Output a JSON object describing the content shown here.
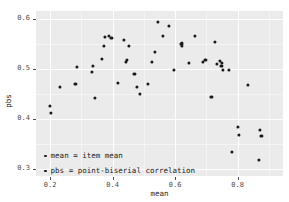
{
  "chart_data": {
    "type": "scatter",
    "title": "",
    "xlabel": "mean",
    "ylabel": "pbs",
    "xlim": [
      0.155,
      0.945
    ],
    "ylim": [
      0.285,
      0.615
    ],
    "xticks": [
      0.2,
      0.4,
      0.6,
      0.8
    ],
    "xtick_labels": [
      "0.2",
      "0.4",
      "0.6",
      "0.8"
    ],
    "yticks": [
      0.3,
      0.4,
      0.5,
      0.6
    ],
    "ytick_labels": [
      "0.3",
      "0.4",
      "0.5",
      "0.6"
    ],
    "grid": true,
    "grid_major_color": "#ffffff",
    "panel_background": "#ebebeb",
    "point_color": "#1a1a1a",
    "legend": {
      "position": "inside-bottom-left",
      "entries": [
        "mean = item mean",
        "pbs = point-biserial correlation"
      ]
    },
    "points": [
      {
        "x": 0.2,
        "y": 0.425
      },
      {
        "x": 0.203,
        "y": 0.412
      },
      {
        "x": 0.232,
        "y": 0.464
      },
      {
        "x": 0.281,
        "y": 0.47
      },
      {
        "x": 0.286,
        "y": 0.503
      },
      {
        "x": 0.334,
        "y": 0.494
      },
      {
        "x": 0.338,
        "y": 0.506
      },
      {
        "x": 0.344,
        "y": 0.442
      },
      {
        "x": 0.366,
        "y": 0.52
      },
      {
        "x": 0.372,
        "y": 0.545
      },
      {
        "x": 0.375,
        "y": 0.563
      },
      {
        "x": 0.388,
        "y": 0.566
      },
      {
        "x": 0.396,
        "y": 0.561
      },
      {
        "x": 0.416,
        "y": 0.471
      },
      {
        "x": 0.435,
        "y": 0.557
      },
      {
        "x": 0.443,
        "y": 0.514
      },
      {
        "x": 0.446,
        "y": 0.518
      },
      {
        "x": 0.452,
        "y": 0.546
      },
      {
        "x": 0.47,
        "y": 0.489
      },
      {
        "x": 0.478,
        "y": 0.464
      },
      {
        "x": 0.488,
        "y": 0.449
      },
      {
        "x": 0.513,
        "y": 0.469
      },
      {
        "x": 0.525,
        "y": 0.514
      },
      {
        "x": 0.536,
        "y": 0.533
      },
      {
        "x": 0.545,
        "y": 0.593
      },
      {
        "x": 0.562,
        "y": 0.565
      },
      {
        "x": 0.58,
        "y": 0.586
      },
      {
        "x": 0.597,
        "y": 0.498
      },
      {
        "x": 0.62,
        "y": 0.549
      },
      {
        "x": 0.621,
        "y": 0.546
      },
      {
        "x": 0.622,
        "y": 0.552
      },
      {
        "x": 0.643,
        "y": 0.511
      },
      {
        "x": 0.664,
        "y": 0.565
      },
      {
        "x": 0.688,
        "y": 0.513
      },
      {
        "x": 0.697,
        "y": 0.517
      },
      {
        "x": 0.716,
        "y": 0.443
      },
      {
        "x": 0.726,
        "y": 0.554
      },
      {
        "x": 0.733,
        "y": 0.509
      },
      {
        "x": 0.744,
        "y": 0.516
      },
      {
        "x": 0.748,
        "y": 0.506
      },
      {
        "x": 0.75,
        "y": 0.511
      },
      {
        "x": 0.752,
        "y": 0.498
      },
      {
        "x": 0.772,
        "y": 0.497
      },
      {
        "x": 0.782,
        "y": 0.333
      },
      {
        "x": 0.8,
        "y": 0.383
      },
      {
        "x": 0.805,
        "y": 0.368
      },
      {
        "x": 0.832,
        "y": 0.468
      },
      {
        "x": 0.872,
        "y": 0.377
      },
      {
        "x": 0.876,
        "y": 0.366
      },
      {
        "x": 0.868,
        "y": 0.318
      }
    ]
  }
}
